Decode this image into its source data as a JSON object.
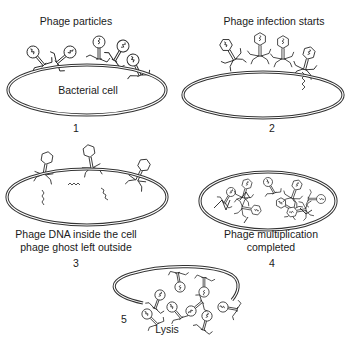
{
  "diagram": {
    "type": "phage-lifecycle",
    "panels": [
      {
        "number": "1",
        "title": "Phage particles",
        "cell_label": "Bacterial cell"
      },
      {
        "number": "2",
        "title": "Phage infection starts"
      },
      {
        "number": "3",
        "caption_line1": "Phage DNA inside the cell",
        "caption_line2": "phage ghost left outside"
      },
      {
        "number": "4",
        "caption_line1": "Phage multiplication",
        "caption_line2": "completed"
      },
      {
        "number": "5",
        "caption": "Lysis"
      }
    ],
    "colors": {
      "line": "#222222",
      "background": "#ffffff"
    }
  }
}
